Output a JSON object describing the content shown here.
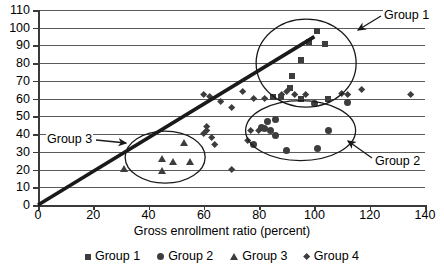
{
  "chart_data": {
    "type": "scatter",
    "title": "",
    "xlabel": "Gross enrollment ratio (percent)",
    "ylabel": "",
    "xlim": [
      0,
      140
    ],
    "ylim": [
      0,
      110
    ],
    "xticks": [
      0,
      20,
      40,
      60,
      80,
      100,
      120,
      140
    ],
    "yticks": [
      0,
      10,
      20,
      30,
      40,
      50,
      60,
      70,
      80,
      90,
      100,
      110
    ],
    "grid": "horizontal",
    "legend_position": "bottom",
    "trendline": {
      "x": [
        0,
        100
      ],
      "y": [
        0,
        95
      ],
      "style": "thick-solid"
    },
    "series": [
      {
        "name": "Group 1",
        "marker": "square",
        "points": [
          [
            101,
            98
          ],
          [
            98,
            92
          ],
          [
            104,
            91
          ],
          [
            95,
            82
          ],
          [
            92,
            73
          ],
          [
            91,
            66
          ],
          [
            95,
            60
          ],
          [
            105,
            60
          ],
          [
            85,
            61
          ],
          [
            88,
            61
          ]
        ]
      },
      {
        "name": "Group 2",
        "marker": "circle",
        "points": [
          [
            100,
            57
          ],
          [
            83,
            47
          ],
          [
            86,
            48
          ],
          [
            81,
            44
          ],
          [
            82,
            43
          ],
          [
            84,
            42
          ],
          [
            86,
            39
          ],
          [
            105,
            42
          ],
          [
            78,
            34
          ],
          [
            90,
            31
          ],
          [
            101,
            32
          ],
          [
            112,
            58
          ]
        ]
      },
      {
        "name": "Group 3",
        "marker": "triangle",
        "points": [
          [
            53,
            35
          ],
          [
            45,
            26
          ],
          [
            49,
            24
          ],
          [
            55,
            24
          ],
          [
            45,
            19
          ],
          [
            31,
            20
          ]
        ]
      },
      {
        "name": "Group 4",
        "marker": "diamond",
        "points": [
          [
            60,
            62
          ],
          [
            62,
            61
          ],
          [
            66,
            58
          ],
          [
            70,
            55
          ],
          [
            61,
            44
          ],
          [
            61,
            42
          ],
          [
            60,
            40
          ],
          [
            63,
            38
          ],
          [
            64,
            34
          ],
          [
            70,
            20
          ],
          [
            76,
            36
          ],
          [
            77,
            42
          ],
          [
            80,
            42
          ],
          [
            88,
            62
          ],
          [
            90,
            64
          ],
          [
            93,
            62
          ],
          [
            97,
            62
          ],
          [
            110,
            63
          ],
          [
            112,
            62
          ],
          [
            117,
            65
          ],
          [
            135,
            62
          ],
          [
            78,
            60
          ],
          [
            82,
            60
          ],
          [
            74,
            64
          ]
        ]
      }
    ],
    "annotations": [
      {
        "label": "Group 1",
        "target_x": 104,
        "target_y": 92
      },
      {
        "label": "Group 2",
        "target_x": 110,
        "target_y": 40
      },
      {
        "label": "Group 3",
        "target_x": 38,
        "target_y": 33
      }
    ]
  },
  "axes": {
    "y_labels": [
      "110",
      "100",
      "90",
      "80",
      "70",
      "60",
      "50",
      "40",
      "30",
      "20",
      "10",
      "0"
    ],
    "x_labels": [
      "0",
      "20",
      "40",
      "60",
      "80",
      "100",
      "120",
      "140"
    ],
    "x_title": "Gross enrollment ratio (percent)"
  },
  "labels": {
    "group1": "Group 1",
    "group2": "Group 2",
    "group3": "Group 3"
  },
  "legend": {
    "items": [
      {
        "label": "Group 1",
        "marker": "square"
      },
      {
        "label": "Group 2",
        "marker": "circle"
      },
      {
        "label": "Group 3",
        "marker": "triangle"
      },
      {
        "label": "Group 4",
        "marker": "diamond"
      }
    ]
  },
  "colors": {
    "marker": "#3d3d3d",
    "grid": "#5a5a5a",
    "axis": "#3a3a3a",
    "trendline": "#1a1a1a"
  }
}
